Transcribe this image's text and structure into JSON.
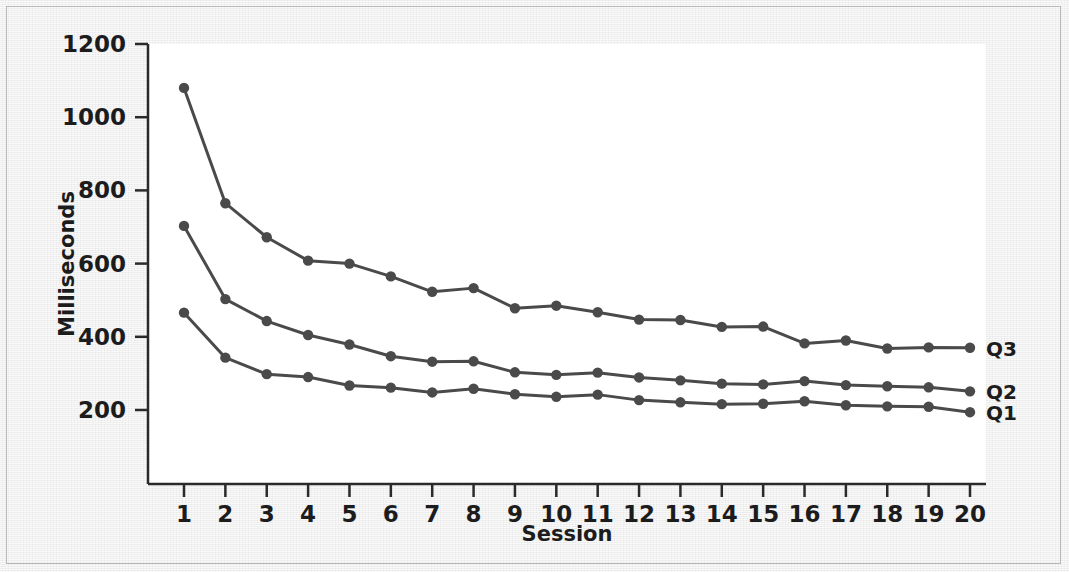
{
  "chart_data": {
    "type": "line",
    "title": "",
    "subtitle": "",
    "xlabel": "Session",
    "ylabel": "Milliseconds",
    "x": [
      1,
      2,
      3,
      4,
      5,
      6,
      7,
      8,
      9,
      10,
      11,
      12,
      13,
      14,
      15,
      16,
      17,
      18,
      19,
      20
    ],
    "xtick_labels": [
      "1",
      "2",
      "3",
      "4",
      "5",
      "6",
      "7",
      "8",
      "9",
      "10",
      "11",
      "12",
      "13",
      "14",
      "15",
      "16",
      "17",
      "18",
      "19",
      "20"
    ],
    "xlim": [
      1,
      20
    ],
    "ylim": [
      100,
      1200
    ],
    "ytick_values": [
      200,
      400,
      600,
      800,
      1000,
      1200
    ],
    "ytick_labels": [
      "200",
      "400",
      "600",
      "800",
      "1000",
      "1200"
    ],
    "grid": false,
    "legend_position": "right-of-line-ends",
    "marker": "filled-circle",
    "series": [
      {
        "name": "Q3",
        "label": "Q3",
        "color": "#4a4a4a",
        "values": [
          1080,
          765,
          672,
          608,
          600,
          565,
          523,
          533,
          478,
          485,
          467,
          447,
          446,
          427,
          428,
          382,
          390,
          368,
          371,
          370
        ]
      },
      {
        "name": "Q2",
        "label": "Q2",
        "color": "#4a4a4a",
        "values": [
          703,
          503,
          443,
          405,
          379,
          347,
          332,
          333,
          303,
          296,
          302,
          289,
          281,
          272,
          270,
          279,
          268,
          265,
          262,
          251
        ]
      },
      {
        "name": "Q1",
        "label": "Q1",
        "color": "#4a4a4a",
        "values": [
          466,
          343,
          298,
          290,
          267,
          261,
          248,
          258,
          243,
          236,
          242,
          227,
          221,
          216,
          217,
          224,
          213,
          210,
          209,
          194
        ]
      }
    ]
  },
  "style": {
    "axis_color": "#2a2a2a",
    "line_color": "#4a4a4a",
    "marker_color": "#4a4a4a",
    "plot_background": "#ffffff",
    "figure_background": "#ececec"
  }
}
